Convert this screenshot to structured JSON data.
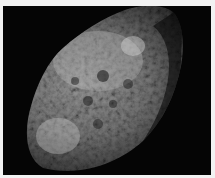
{
  "image": {
    "subject": "Hyperion moon surface photograph",
    "alt": "Sponge-like cratered surface of Saturn's moon Hyperion against black space",
    "colors": {
      "background": "#050505",
      "border": "#f2f2f2",
      "surface_light": "#c8c8c8",
      "surface_mid": "#7a7a7a",
      "surface_dark": "#2a2a2a"
    }
  }
}
